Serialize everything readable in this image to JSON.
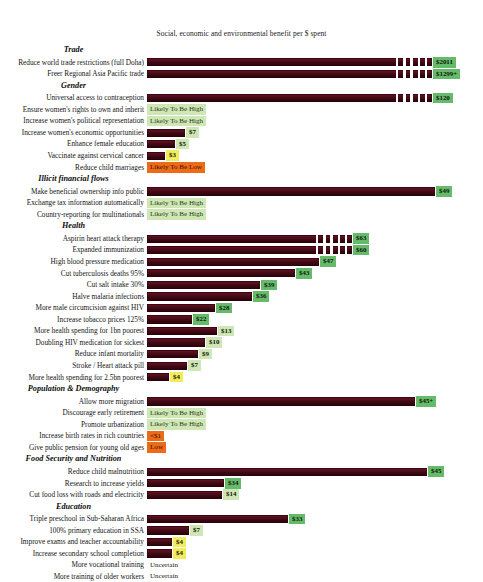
{
  "chart_title": "Social, economic and environmental benefit per $ spent",
  "colors": {
    "bar_dark_red": "#4a0c16",
    "value_green": "#66bb6a",
    "value_light_green": "#cfe7b4",
    "value_yellow": "#f2ec5a",
    "value_orange": "#ec6a18",
    "background": "#ffffff"
  },
  "chart_data": {
    "type": "bar",
    "title": "Social, economic and environmental benefit per $ spent",
    "xlabel": "",
    "ylabel": "",
    "orientation": "horizontal",
    "grid": false,
    "legend": "none",
    "note": "Bar lengths are scaled non-linearly; very long bars are drawn broken. Values prefixed with $ are benefit per $ spent.",
    "groups": [
      {
        "group": "Trade",
        "items": [
          {
            "label": "Reduce world trade restrictions (full Doha)",
            "value": "$2011",
            "numeric": 2011,
            "style": "green",
            "bar": true,
            "bar_len": 285,
            "broken": true
          },
          {
            "label": "Freer Regional Asia Pacific trade",
            "value": "$1299+",
            "numeric": 1299,
            "style": "green",
            "bar": true,
            "bar_len": 285,
            "broken": true
          }
        ]
      },
      {
        "group": "Gender",
        "items": [
          {
            "label": "Universal access to contraception",
            "value": "$120",
            "numeric": 120,
            "style": "green",
            "bar": true,
            "bar_len": 285,
            "broken": true
          },
          {
            "label": "Ensure women's rights to own and inherit",
            "value": "Likely To Be High",
            "numeric": null,
            "style": "text-lightgreen",
            "bar": false
          },
          {
            "label": "Increase women's political representation",
            "value": "Likely To Be High",
            "numeric": null,
            "style": "text-lightgreen",
            "bar": false
          },
          {
            "label": "Increase women's economic opportunities",
            "value": "$7",
            "numeric": 7,
            "style": "lightgreen",
            "bar": true,
            "bar_len": 38
          },
          {
            "label": "Enhance female education",
            "value": "$5",
            "numeric": 5,
            "style": "lightgreen",
            "bar": true,
            "bar_len": 28
          },
          {
            "label": "Vaccinate against cervical cancer",
            "value": "$3",
            "numeric": 3,
            "style": "yellow",
            "bar": true,
            "bar_len": 18
          },
          {
            "label": "Reduce child marriages",
            "value": "Likely To Be Low",
            "numeric": null,
            "style": "text-orange",
            "bar": false
          }
        ]
      },
      {
        "group": "Illicit financial flows",
        "items": [
          {
            "label": "Make beneficial ownership info public",
            "value": "$49",
            "numeric": 49,
            "style": "green",
            "bar": true,
            "bar_len": 288
          },
          {
            "label": "Exchange tax information automatically",
            "value": "Likely To Be High",
            "numeric": null,
            "style": "text-lightgreen",
            "bar": false
          },
          {
            "label": "Country-reporting for multinationals",
            "value": "Likely To Be High",
            "numeric": null,
            "style": "text-lightgreen",
            "bar": false
          }
        ]
      },
      {
        "group": "Health",
        "items": [
          {
            "label": "Aspirin heart attack therapy",
            "value": "$63",
            "numeric": 63,
            "style": "green",
            "bar": true,
            "bar_len": 205,
            "broken": true
          },
          {
            "label": "Expanded immunization",
            "value": "$60",
            "numeric": 60,
            "style": "green",
            "bar": true,
            "bar_len": 205,
            "broken": true
          },
          {
            "label": "High blood pressure medication",
            "value": "$47",
            "numeric": 47,
            "style": "green",
            "bar": true,
            "bar_len": 172
          },
          {
            "label": "Cut tuberculosis deaths 95%",
            "value": "$43",
            "numeric": 43,
            "style": "green",
            "bar": true,
            "bar_len": 148
          },
          {
            "label": "Cut salt intake 30%",
            "value": "$39",
            "numeric": 39,
            "style": "green",
            "bar": true,
            "bar_len": 113
          },
          {
            "label": "Halve malaria infections",
            "value": "$36",
            "numeric": 36,
            "style": "green",
            "bar": true,
            "bar_len": 105
          },
          {
            "label": "More male circumcision against HIV",
            "value": "$28",
            "numeric": 28,
            "style": "green",
            "bar": true,
            "bar_len": 68
          },
          {
            "label": "Increase tobacco prices 125%",
            "value": "$22",
            "numeric": 22,
            "style": "green",
            "bar": true,
            "bar_len": 45
          },
          {
            "label": "More health spending for 1bn poorest",
            "value": "$13",
            "numeric": 13,
            "style": "lightgreen",
            "bar": true,
            "bar_len": 70
          },
          {
            "label": "Doubling HIV medication for sickest",
            "value": "$10",
            "numeric": 10,
            "style": "lightgreen",
            "bar": true,
            "bar_len": 58
          },
          {
            "label": "Reduce infant mortality",
            "value": "$9",
            "numeric": 9,
            "style": "lightgreen",
            "bar": true,
            "bar_len": 51
          },
          {
            "label": "Stroke / Heart attack pill",
            "value": "$7",
            "numeric": 7,
            "style": "lightgreen",
            "bar": true,
            "bar_len": 40
          },
          {
            "label": "More health spending for 2.5bn poorest",
            "value": "$4",
            "numeric": 4,
            "style": "yellow",
            "bar": true,
            "bar_len": 22
          }
        ]
      },
      {
        "group": "Population & Demography",
        "items": [
          {
            "label": "Allow more migration",
            "value": "$45+",
            "numeric": 45,
            "style": "green",
            "bar": true,
            "bar_len": 268
          },
          {
            "label": "Discourage early retirement",
            "value": "Likely To Be High",
            "numeric": null,
            "style": "text-lightgreen",
            "bar": false
          },
          {
            "label": "Promote urbanization",
            "value": "Likely To Be High",
            "numeric": null,
            "style": "text-lightgreen",
            "bar": false
          },
          {
            "label": "Increase birth rates in rich countries",
            "value": "<$1",
            "numeric": 1,
            "style": "text-orange",
            "bar": false
          },
          {
            "label": "Give public pension for young old ages",
            "value": "Low",
            "numeric": null,
            "style": "text-orange",
            "bar": false
          }
        ]
      },
      {
        "group": "Food Security and Nutrition",
        "items": [
          {
            "label": "Reduce child malnutrition",
            "value": "$45",
            "numeric": 45,
            "style": "green",
            "bar": true,
            "bar_len": 280
          },
          {
            "label": "Research to increase yields",
            "value": "$34",
            "numeric": 34,
            "style": "green",
            "bar": true,
            "bar_len": 77
          },
          {
            "label": "Cut food loss with roads and electricity",
            "value": "$14",
            "numeric": 14,
            "style": "lightgreen",
            "bar": true,
            "bar_len": 75
          }
        ]
      },
      {
        "group": "Education",
        "items": [
          {
            "label": "Triple preschool in Sub-Saharan Africa",
            "value": "$33",
            "numeric": 33,
            "style": "green",
            "bar": true,
            "bar_len": 141
          },
          {
            "label": "100% primary education in SSA",
            "value": "$7",
            "numeric": 7,
            "style": "lightgreen",
            "bar": true,
            "bar_len": 42
          },
          {
            "label": "Improve exams and teacher accountability",
            "value": "$4",
            "numeric": 4,
            "style": "yellow",
            "bar": true,
            "bar_len": 25
          },
          {
            "label": "Increase secondary school completion",
            "value": "$4",
            "numeric": 4,
            "style": "yellow",
            "bar": true,
            "bar_len": 25
          },
          {
            "label": "More vocational training",
            "value": "Uncertain",
            "numeric": null,
            "style": "text-plain",
            "bar": false
          },
          {
            "label": "More training of older workers",
            "value": "Uncertain",
            "numeric": null,
            "style": "text-plain",
            "bar": false
          }
        ]
      }
    ]
  }
}
